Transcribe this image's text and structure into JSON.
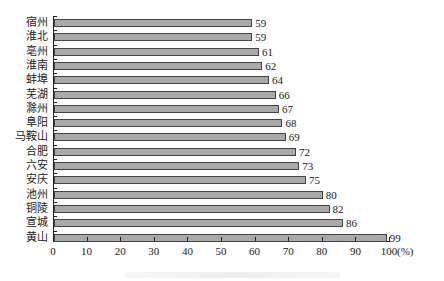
{
  "chart_data": {
    "type": "bar",
    "orientation": "horizontal",
    "title": "",
    "xlabel": "(%)",
    "ylabel": "",
    "xlim": [
      0,
      100
    ],
    "x_ticks": [
      0,
      10,
      20,
      30,
      40,
      50,
      60,
      70,
      80,
      90,
      100
    ],
    "grid": false,
    "legend": null,
    "categories": [
      "宿州",
      "淮北",
      "亳州",
      "淮南",
      "蚌埠",
      "芜湖",
      "滁州",
      "阜阳",
      "马鞍山",
      "合肥",
      "六安",
      "安庆",
      "池州",
      "铜陵",
      "宣城",
      "黄山"
    ],
    "values": [
      59,
      59,
      61,
      62,
      64,
      66,
      67,
      68,
      69,
      72,
      73,
      75,
      80,
      82,
      86,
      99
    ],
    "data_labels": true,
    "bar_color": "#a9a9a9",
    "bar_edge_color": "#444444"
  },
  "axis": {
    "tick_labels": [
      "0",
      "10",
      "20",
      "30",
      "40",
      "50",
      "60",
      "70",
      "80",
      "90",
      "100"
    ],
    "unit_label": "(%)"
  }
}
